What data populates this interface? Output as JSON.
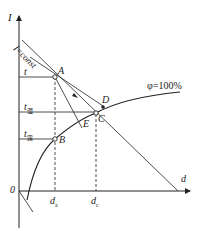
{
  "diagram": {
    "type": "psychrometric I-d chart (enthalpy-humidity)",
    "axes": {
      "y_label": "I",
      "x_label": "d",
      "origin_label": "0"
    },
    "curve": {
      "label": "φ=100%",
      "description": "saturation curve"
    },
    "isenthalp": {
      "label": "I=const"
    },
    "points": [
      {
        "id": "A",
        "label": "A"
      },
      {
        "id": "B",
        "label": "B"
      },
      {
        "id": "C",
        "label": "C"
      },
      {
        "id": "D",
        "label": "D"
      },
      {
        "id": "E",
        "label": "E"
      }
    ],
    "temperature_levels": [
      {
        "label": "t",
        "sub": ""
      },
      {
        "label": "t",
        "sub": "湿"
      },
      {
        "label": "t",
        "sub": "露"
      }
    ],
    "humidity_levels": [
      {
        "label": "d",
        "sub": "a"
      },
      {
        "label": "d",
        "sub": "c"
      }
    ],
    "colors": {
      "line": "#222222",
      "background": "#ffffff"
    }
  }
}
